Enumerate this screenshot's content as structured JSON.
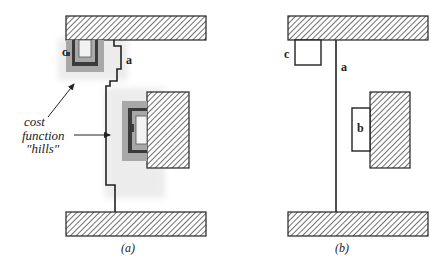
{
  "figure": {
    "panels": [
      {
        "id": "a",
        "caption": "(a)",
        "path_label": "a",
        "obstacle_label": "c",
        "annotation": {
          "lines": [
            "cost",
            "function",
            "\"hills\""
          ]
        }
      },
      {
        "id": "b",
        "caption": "(b)",
        "path_label": "a",
        "box_labels": {
          "upper_left": "c",
          "right": "b"
        }
      }
    ],
    "colors": {
      "stroke": "#222222",
      "hatch": "#333333",
      "hill_outer": "#a8a8a8",
      "hill_mid": "#d0d0d0",
      "hill_core": "#3a3a3a",
      "halo": "#eeeeee"
    }
  }
}
